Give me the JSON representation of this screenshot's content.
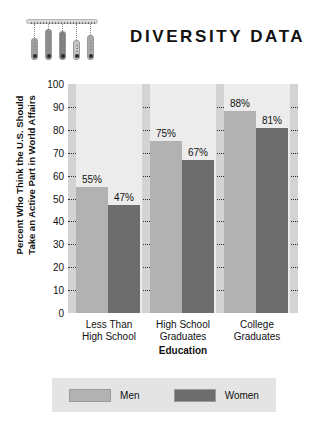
{
  "header": {
    "title": "DIVERSITY DATA",
    "decoration": {
      "name": "hanging-bars-graphic",
      "bars": [
        {
          "height": 22,
          "shade": "#9f9f9f",
          "stem": 14
        },
        {
          "height": 31,
          "shade": "#8e8e8e",
          "stem": 5
        },
        {
          "height": 29,
          "shade": "#7e7e7e",
          "stem": 7
        },
        {
          "height": 20,
          "shade": "#c4c4c4",
          "stem": 16
        },
        {
          "height": 25,
          "shade": "#a8a8a8",
          "stem": 11
        }
      ]
    }
  },
  "chart_data": {
    "type": "bar",
    "title": "DIVERSITY DATA",
    "xlabel": "Education",
    "ylabel": "Percent Who Think the U.S. Should Take an Active Part in World Affairs",
    "ylabel_lines": [
      "Percent Who Think the U.S. Should",
      "Take an Active Part in World Affairs"
    ],
    "categories": [
      "Less Than High School",
      "High School Graduates",
      "College Graduates"
    ],
    "category_lines": [
      [
        "Less Than",
        "High School"
      ],
      [
        "High School",
        "Graduates"
      ],
      [
        "College",
        "Graduates"
      ]
    ],
    "series": [
      {
        "name": "Men",
        "color": "#b2b2b2",
        "values": [
          55,
          75,
          88
        ],
        "labels": [
          "55%",
          "75%",
          "88%"
        ]
      },
      {
        "name": "Women",
        "color": "#6d6d6d",
        "values": [
          47,
          67,
          81
        ],
        "labels": [
          "47%",
          "67%",
          "81%"
        ]
      }
    ],
    "ylim": [
      0,
      100
    ],
    "yticks": [
      0,
      10,
      20,
      30,
      40,
      50,
      60,
      70,
      80,
      90,
      100
    ],
    "ytick_labels": [
      "0",
      "10",
      "20",
      "30",
      "40",
      "50",
      "60",
      "70",
      "80",
      "90",
      "100"
    ],
    "grid": true,
    "grid_style": "dotted",
    "legend_position": "bottom",
    "plot_background": "#d3d3d3",
    "group_background": "#ececec"
  },
  "legend": {
    "items": [
      {
        "label": "Men",
        "color": "#b2b2b2"
      },
      {
        "label": "Women",
        "color": "#6d6d6d"
      }
    ]
  }
}
